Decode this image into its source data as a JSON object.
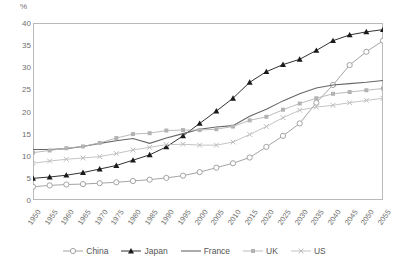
{
  "chart_data": {
    "type": "line",
    "title": "",
    "xlabel": "",
    "ylabel": "%",
    "ylim": [
      0,
      40
    ],
    "yticks": [
      0,
      5,
      10,
      15,
      20,
      25,
      30,
      35,
      40
    ],
    "grid": false,
    "legend_position": "bottom",
    "x": [
      1950,
      1955,
      1960,
      1965,
      1970,
      1975,
      1980,
      1985,
      1990,
      1995,
      2000,
      2005,
      2010,
      2015,
      2020,
      2025,
      2030,
      2035,
      2040,
      2045,
      2050,
      2055
    ],
    "xtick_labels": [
      "1950",
      "1955",
      "1960",
      "1965",
      "1970",
      "1975",
      "1980",
      "1985",
      "1990",
      "1995",
      "2000",
      "2005",
      "2010",
      "2015",
      "2020",
      "2025",
      "2030",
      "2035",
      "2040",
      "2045",
      "2050",
      "2055"
    ],
    "series": [
      {
        "name": "China",
        "marker": "open-circle",
        "color": "#9a9a9a",
        "values": [
          3.0,
          3.3,
          3.5,
          3.6,
          3.8,
          4.0,
          4.3,
          4.6,
          5.0,
          5.5,
          6.3,
          7.3,
          8.3,
          9.6,
          12.0,
          14.5,
          17.3,
          22.0,
          26.0,
          30.5,
          33.5,
          36.0
        ]
      },
      {
        "name": "Japan",
        "marker": "filled-triangle",
        "color": "#1a1a1a",
        "values": [
          4.9,
          5.2,
          5.6,
          6.2,
          7.0,
          7.8,
          9.0,
          10.2,
          12.0,
          14.5,
          17.3,
          20.1,
          23.0,
          26.6,
          29.0,
          30.6,
          31.8,
          33.8,
          36.0,
          37.3,
          38.0,
          38.5
        ]
      },
      {
        "name": "France",
        "marker": "none",
        "color": "#666666",
        "values": [
          11.4,
          11.4,
          11.6,
          12.1,
          12.8,
          13.4,
          13.9,
          12.8,
          14.0,
          15.0,
          16.0,
          16.5,
          16.8,
          18.9,
          20.5,
          22.4,
          24.0,
          25.3,
          26.0,
          26.3,
          26.6,
          27.0
        ]
      },
      {
        "name": "UK",
        "marker": "small-square",
        "color": "#b3b3b3",
        "values": [
          10.7,
          11.2,
          11.7,
          12.1,
          12.9,
          14.0,
          14.9,
          15.1,
          15.7,
          15.8,
          15.8,
          16.0,
          16.6,
          18.0,
          18.8,
          20.4,
          21.8,
          23.0,
          24.0,
          24.4,
          24.8,
          25.2
        ]
      },
      {
        "name": "US",
        "marker": "x",
        "color": "#bdbdbd",
        "values": [
          8.3,
          8.8,
          9.2,
          9.5,
          9.8,
          10.5,
          11.3,
          11.9,
          12.5,
          12.6,
          12.4,
          12.4,
          13.1,
          14.8,
          16.6,
          18.6,
          20.3,
          21.0,
          21.4,
          22.0,
          22.5,
          23.0
        ]
      }
    ]
  },
  "legend": {
    "items": [
      {
        "label": "China"
      },
      {
        "label": "Japan"
      },
      {
        "label": "France"
      },
      {
        "label": "UK"
      },
      {
        "label": "US"
      }
    ]
  }
}
